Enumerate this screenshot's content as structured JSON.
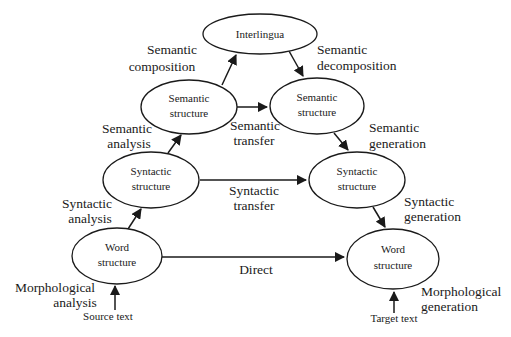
{
  "colors": {
    "stroke": "#1a1a1a",
    "background": "#ffffff"
  },
  "nodes": {
    "interlingua": {
      "line1": "Interlingua"
    },
    "semantic_source": {
      "line1": "Semantic",
      "line2": "structure"
    },
    "semantic_target": {
      "line1": "Semantic",
      "line2": "structure"
    },
    "syntactic_source": {
      "line1": "Syntactic",
      "line2": "structure"
    },
    "syntactic_target": {
      "line1": "Syntactic",
      "line2": "structure"
    },
    "word_source": {
      "line1": "Word",
      "line2": "structure"
    },
    "word_target": {
      "line1": "Word",
      "line2": "structure"
    }
  },
  "edge_labels": {
    "semantic_composition": {
      "line1": "Semantic",
      "line2": "composition"
    },
    "semantic_decomposition": {
      "line1": "Semantic",
      "line2": "decomposition"
    },
    "semantic_analysis": {
      "line1": "Semantic",
      "line2": "analysis"
    },
    "semantic_transfer": {
      "line1": "Semantic",
      "line2": "transfer"
    },
    "semantic_generation": {
      "line1": "Semantic",
      "line2": "generation"
    },
    "syntactic_analysis": {
      "line1": "Syntactic",
      "line2": "analysis"
    },
    "syntactic_transfer": {
      "line1": "Syntactic",
      "line2": "transfer"
    },
    "syntactic_generation": {
      "line1": "Syntactic",
      "line2": "generation"
    },
    "direct": {
      "line1": "Direct"
    },
    "morphological_analysis": {
      "line1": "Morphological",
      "line2": "analysis"
    },
    "morphological_generation": {
      "line1": "Morphological",
      "line2": "generation"
    }
  },
  "io": {
    "source_text": "Source text",
    "target_text": "Target text"
  }
}
